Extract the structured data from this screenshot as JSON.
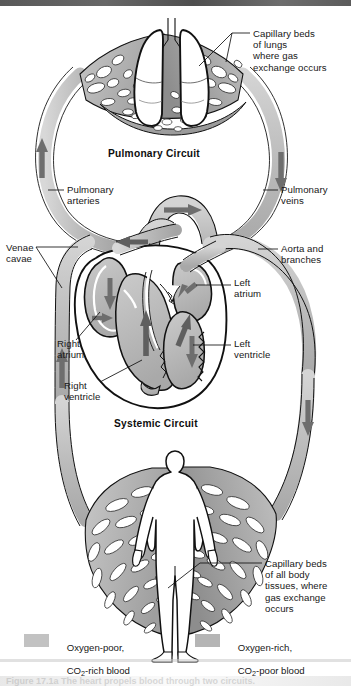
{
  "figure": {
    "circuits": [
      {
        "id": "pulmonary",
        "label": "Pulmonary Circuit",
        "x": 108,
        "y": 148
      },
      {
        "id": "systemic",
        "label": "Systemic Circuit",
        "x": 114,
        "y": 418
      }
    ],
    "labels": [
      {
        "id": "capillary-beds-lungs",
        "text": "Capillary beds\nof lungs\nwhere gas\nexchange occurs",
        "x": 253,
        "y": 28,
        "align": "left"
      },
      {
        "id": "pulmonary-arteries",
        "text": "Pulmonary\narteries",
        "x": 67,
        "y": 184,
        "align": "left"
      },
      {
        "id": "pulmonary-veins",
        "text": "Pulmonary\nveins",
        "x": 281,
        "y": 184,
        "align": "left"
      },
      {
        "id": "venae-cavae",
        "text": "Venae\ncavae",
        "x": 6,
        "y": 242,
        "align": "left"
      },
      {
        "id": "aorta-and-branches",
        "text": "Aorta and\nbranches",
        "x": 281,
        "y": 243,
        "align": "left"
      },
      {
        "id": "left-atrium",
        "text": "Left\natrium",
        "x": 234,
        "y": 277,
        "align": "left"
      },
      {
        "id": "right-atrium",
        "text": "Right\natrium",
        "x": 57,
        "y": 338,
        "align": "left"
      },
      {
        "id": "left-ventricle",
        "text": "Left\nventricle",
        "x": 234,
        "y": 338,
        "align": "left"
      },
      {
        "id": "right-ventricle",
        "text": "Right\nventricle",
        "x": 64,
        "y": 380,
        "align": "left"
      },
      {
        "id": "capillary-beds-body",
        "text": "Capillary beds\nof all body\ntissues, where\ngas exchange\noccurs",
        "x": 265,
        "y": 558,
        "align": "left"
      }
    ],
    "legend": [
      {
        "id": "oxygen-poor",
        "line1": "Oxygen-poor,",
        "line2_pre": "CO",
        "line2_sub": "2",
        "line2_post": "-rich blood",
        "swatch_color": "#c2c2c2",
        "swatch_x": 24,
        "swatch_y": 634,
        "text_x": 56,
        "text_y": 631
      },
      {
        "id": "oxygen-rich",
        "line1": "Oxygen-rich,",
        "line2_pre": "CO",
        "line2_sub": "2",
        "line2_post": "-poor blood",
        "swatch_color": "#b5b5b5",
        "swatch_x": 195,
        "swatch_y": 634,
        "text_x": 227,
        "text_y": 631
      }
    ],
    "caption": "Figure 17.1a  The heart propels blood through two circuits.",
    "colors": {
      "vessel_light": "#c9c9c9",
      "vessel_mid": "#b2b2b2",
      "vessel_dark": "#9a9a9a",
      "arrow": "#6e6e6e",
      "outline": "#111111",
      "background": "#ffffff",
      "text": "#171717"
    }
  }
}
